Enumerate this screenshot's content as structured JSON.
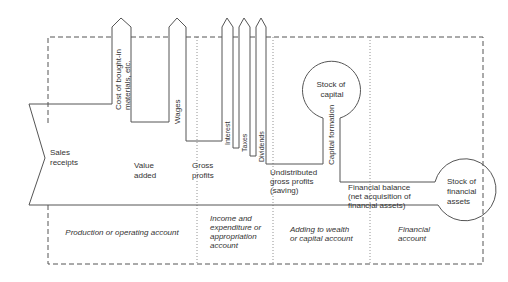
{
  "flows": {
    "sales_receipts": [
      "Sales",
      "receipts"
    ],
    "cost_bought_in": [
      "Cost of bought-in",
      "materials, etc."
    ],
    "wages": "Wages",
    "value_added": [
      "Value",
      "added"
    ],
    "gross_profits": [
      "Gross",
      "profits"
    ],
    "interest": "Interest",
    "taxes": "Taxes",
    "dividends": "Dividends",
    "undistributed": [
      "Undistributed",
      "gross profits",
      "(saving)"
    ],
    "capital_formation": "Capital formation",
    "financial_balance": [
      "Financial balance",
      "(net acquisition of",
      "financial assets)"
    ]
  },
  "stocks": {
    "capital": [
      "Stock of",
      "capital"
    ],
    "financial_assets": [
      "Stock of",
      "financial",
      "assets"
    ]
  },
  "accounts": {
    "production": "Production or operating account",
    "income": [
      "Income and",
      "expenditure or",
      "appropriation",
      "account"
    ],
    "wealth": [
      "Adding to wealth",
      "or capital account"
    ],
    "financial": [
      "Financial",
      "account"
    ]
  }
}
